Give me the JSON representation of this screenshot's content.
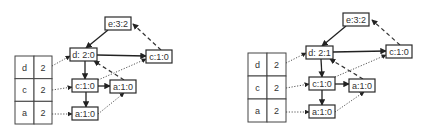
{
  "diagrams": [
    {
      "id": "left",
      "header_table": {
        "x": 15,
        "y": 56,
        "w": 37,
        "h": 68,
        "split": 34,
        "rows": [
          {
            "item": "d",
            "count": "2"
          },
          {
            "item": "c",
            "count": "2"
          },
          {
            "item": "a",
            "count": "2"
          }
        ]
      },
      "nodes": [
        {
          "key": "e",
          "label": "e:3:2",
          "x": 105,
          "y": 17,
          "w": 26,
          "h": 13
        },
        {
          "key": "d",
          "label": "d: 2:0",
          "x": 70,
          "y": 48,
          "w": 27,
          "h": 13
        },
        {
          "key": "c_top",
          "label": "c:1:0",
          "x": 146,
          "y": 50,
          "w": 26,
          "h": 13
        },
        {
          "key": "c_mid",
          "label": "c:1:0",
          "x": 72,
          "y": 79,
          "w": 26,
          "h": 13
        },
        {
          "key": "a_right",
          "label": "a:1:0",
          "x": 110,
          "y": 80,
          "w": 26,
          "h": 13
        },
        {
          "key": "a_bot",
          "label": "a:1:0",
          "x": 72,
          "y": 107,
          "w": 26,
          "h": 13
        }
      ],
      "edges": [
        {
          "style": "solid",
          "x1": 108,
          "y1": 30,
          "x2": 86,
          "y2": 48
        },
        {
          "style": "solid",
          "x1": 97,
          "y1": 55,
          "x2": 146,
          "y2": 56
        },
        {
          "style": "solid",
          "x1": 85,
          "y1": 61,
          "x2": 85,
          "y2": 79
        },
        {
          "style": "solid",
          "x1": 98,
          "y1": 86,
          "x2": 110,
          "y2": 86
        },
        {
          "style": "solid",
          "x1": 86,
          "y1": 92,
          "x2": 86,
          "y2": 107
        },
        {
          "style": "dashed",
          "x1": 161,
          "y1": 50,
          "x2": 133,
          "y2": 24
        },
        {
          "style": "dashed",
          "x1": 124,
          "y1": 80,
          "x2": 94,
          "y2": 61
        },
        {
          "style": "dotted",
          "x1": 52,
          "y1": 66,
          "x2": 70,
          "y2": 56
        },
        {
          "style": "dotted",
          "x1": 52,
          "y1": 90,
          "x2": 72,
          "y2": 87
        },
        {
          "style": "dotted",
          "x1": 52,
          "y1": 114,
          "x2": 72,
          "y2": 114
        },
        {
          "style": "dotted",
          "x1": 98,
          "y1": 80,
          "x2": 146,
          "y2": 59
        },
        {
          "style": "dotted",
          "x1": 98,
          "y1": 114,
          "x2": 124,
          "y2": 93
        }
      ]
    },
    {
      "id": "right",
      "header_table": {
        "x": 248,
        "y": 53,
        "w": 38,
        "h": 69,
        "split": 267,
        "rows": [
          {
            "item": "d",
            "count": "2"
          },
          {
            "item": "c",
            "count": "2"
          },
          {
            "item": "a",
            "count": "2"
          }
        ]
      },
      "nodes": [
        {
          "key": "e",
          "label": "e:3:2",
          "x": 343,
          "y": 13,
          "w": 26,
          "h": 13
        },
        {
          "key": "d",
          "label": "d: 2:1",
          "x": 306,
          "y": 46,
          "w": 27,
          "h": 13
        },
        {
          "key": "c_top",
          "label": "c:1:0",
          "x": 386,
          "y": 45,
          "w": 26,
          "h": 13
        },
        {
          "key": "c_mid",
          "label": "c:1:0",
          "x": 309,
          "y": 77,
          "w": 26,
          "h": 13
        },
        {
          "key": "a_right",
          "label": "a:1:0",
          "x": 349,
          "y": 79,
          "w": 26,
          "h": 13
        },
        {
          "key": "a_bot",
          "label": "a:1:0",
          "x": 309,
          "y": 105,
          "w": 26,
          "h": 13
        }
      ],
      "edges": [
        {
          "style": "solid",
          "x1": 346,
          "y1": 26,
          "x2": 322,
          "y2": 46
        },
        {
          "style": "solid",
          "x1": 333,
          "y1": 52,
          "x2": 386,
          "y2": 51
        },
        {
          "style": "solid",
          "x1": 321,
          "y1": 59,
          "x2": 322,
          "y2": 77
        },
        {
          "style": "solid",
          "x1": 335,
          "y1": 84,
          "x2": 349,
          "y2": 84
        },
        {
          "style": "solid",
          "x1": 322,
          "y1": 90,
          "x2": 322,
          "y2": 105
        },
        {
          "style": "dashed",
          "x1": 400,
          "y1": 45,
          "x2": 372,
          "y2": 20
        },
        {
          "style": "dashed",
          "x1": 363,
          "y1": 79,
          "x2": 330,
          "y2": 59
        },
        {
          "style": "dotted",
          "x1": 286,
          "y1": 63,
          "x2": 306,
          "y2": 53
        },
        {
          "style": "dotted",
          "x1": 286,
          "y1": 88,
          "x2": 309,
          "y2": 84
        },
        {
          "style": "dotted",
          "x1": 286,
          "y1": 112,
          "x2": 309,
          "y2": 112
        },
        {
          "style": "dotted",
          "x1": 335,
          "y1": 77,
          "x2": 386,
          "y2": 55
        },
        {
          "style": "dotted",
          "x1": 335,
          "y1": 112,
          "x2": 364,
          "y2": 92
        }
      ]
    }
  ]
}
